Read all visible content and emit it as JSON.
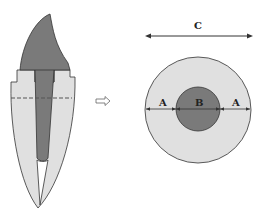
{
  "colors": {
    "background": "#ffffff",
    "dentin": "#e0e0e0",
    "pulp": "#7a7a7a",
    "outline": "#333333",
    "dash": "#555555"
  },
  "tooth": {
    "description": "longitudinal section of tooth with root canal",
    "section_line": "dashed"
  },
  "arrow": {
    "direction": "right",
    "style": "hollow"
  },
  "cross_section": {
    "outer_label": "C",
    "inner_label": "B",
    "side_label_left": "A",
    "side_label_right": "A"
  }
}
